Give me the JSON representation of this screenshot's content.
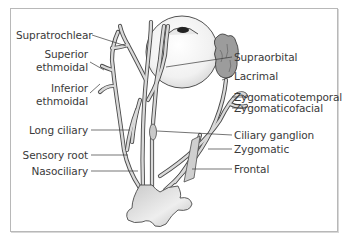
{
  "figure": {
    "labels_left": [
      {
        "id": "supratrochlear",
        "text": "Supratrochlear"
      },
      {
        "id": "superior-ethmoidal-1",
        "text": "Superior"
      },
      {
        "id": "superior-ethmoidal-2",
        "text": "ethmoidal"
      },
      {
        "id": "inferior-ethmoidal-1",
        "text": "Inferior"
      },
      {
        "id": "inferior-ethmoidal-2",
        "text": "ethmoidal"
      },
      {
        "id": "long-ciliary",
        "text": "Long ciliary"
      },
      {
        "id": "sensory-root",
        "text": "Sensory root"
      },
      {
        "id": "nasociliary",
        "text": "Nasociliary"
      }
    ],
    "labels_right": [
      {
        "id": "supraorbital",
        "text": "Supraorbital"
      },
      {
        "id": "lacrimal",
        "text": "Lacrimal"
      },
      {
        "id": "zygomaticotemporal",
        "text": "Zygomaticotemporal"
      },
      {
        "id": "zygomaticofacial",
        "text": "Zygomaticofacial"
      },
      {
        "id": "ciliary-ganglion",
        "text": "Ciliary ganglion"
      },
      {
        "id": "zygomatic",
        "text": "Zygomatic"
      },
      {
        "id": "frontal",
        "text": "Frontal"
      }
    ],
    "colors": {
      "nerve_fill": "#d9d9d9",
      "nerve_stroke": "#4a4a4a",
      "gland_fill": "#9a9a9a",
      "globe_fill": "#f2f2f2",
      "leader_line": "#3a3a3a",
      "label_text": "#3a3a3a",
      "frame_border": "#b8b8b8"
    }
  }
}
